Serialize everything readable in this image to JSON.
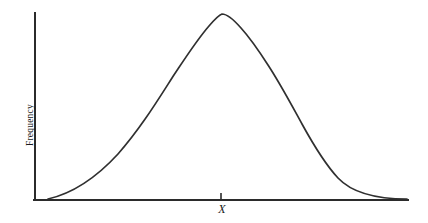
{
  "figure": {
    "background_color": "#ffffff",
    "line_color": "#303030",
    "axis_color": "#2b2b2b"
  },
  "labels": {
    "y_axis": "Frequency",
    "x_tick": "X"
  },
  "chart_data": {
    "type": "line",
    "title": "",
    "xlabel": "",
    "ylabel": "Frequency",
    "grid": false,
    "legend": null,
    "annotations": [
      {
        "text": "X",
        "x": 0.497,
        "y": 0.0,
        "style": "italic",
        "description": "tick mark on horizontal axis marking the mean/center of the distribution"
      }
    ],
    "axis": {
      "x_range": [
        0,
        1
      ],
      "y_range": [
        0,
        1
      ],
      "x_ticks": [
        "X"
      ],
      "y_ticks": [],
      "x_tick_positions": [
        0.497
      ],
      "spines": [
        "left",
        "bottom"
      ]
    },
    "series": [
      {
        "name": "frequency distribution",
        "x": [
          0.035,
          0.08,
          0.13,
          0.18,
          0.23,
          0.28,
          0.31,
          0.34,
          0.38,
          0.42,
          0.46,
          0.5,
          0.54,
          0.58,
          0.62,
          0.66,
          0.7,
          0.74,
          0.78,
          0.82,
          0.86,
          0.9,
          0.94,
          0.97,
          1.0
        ],
        "y": [
          0.005,
          0.06,
          0.16,
          0.27,
          0.39,
          0.51,
          0.58,
          0.66,
          0.76,
          0.85,
          0.93,
          0.985,
          1.0,
          0.985,
          0.94,
          0.87,
          0.78,
          0.68,
          0.57,
          0.45,
          0.33,
          0.21,
          0.11,
          0.05,
          0.005
        ]
      }
    ],
    "svg_path": "M 48 199 C 70 194 95 179 118 154 C 140 129 156 103 172 78 C 186 57 196 41 209 26 C 215 19 219 15 222 14 C 227 14 234 20 241 28 C 251 39 259 51 268 65 C 281 85 291 104 302 124 C 313 144 325 164 338 178 C 354 195 380 199 407 199"
  }
}
